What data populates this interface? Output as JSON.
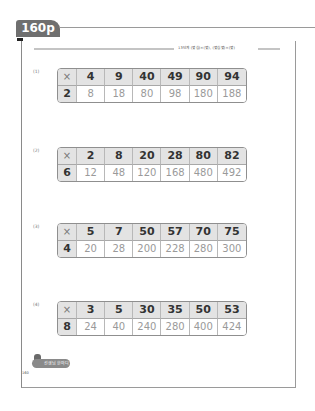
{
  "page_tab": {
    "label": "160p"
  },
  "header": {
    "text": "13단계 (몇십)×(몇), (몇십몇)×(몇)"
  },
  "problems": [
    {
      "number": "(1)",
      "top": 68,
      "operator": "×",
      "multiplier": "2",
      "values": [
        "4",
        "9",
        "40",
        "49",
        "90",
        "94"
      ],
      "products": [
        "8",
        "18",
        "80",
        "98",
        "180",
        "188"
      ]
    },
    {
      "number": "(2)",
      "top": 147,
      "operator": "×",
      "multiplier": "6",
      "values": [
        "2",
        "8",
        "20",
        "28",
        "80",
        "82"
      ],
      "products": [
        "12",
        "48",
        "120",
        "168",
        "480",
        "492"
      ]
    },
    {
      "number": "(3)",
      "top": 223,
      "operator": "×",
      "multiplier": "4",
      "values": [
        "5",
        "7",
        "50",
        "57",
        "70",
        "75"
      ],
      "products": [
        "20",
        "28",
        "200",
        "228",
        "280",
        "300"
      ]
    },
    {
      "number": "(4)",
      "top": 301,
      "operator": "×",
      "multiplier": "8",
      "values": [
        "3",
        "5",
        "30",
        "35",
        "50",
        "53"
      ],
      "products": [
        "24",
        "40",
        "240",
        "280",
        "400",
        "424"
      ]
    }
  ],
  "footer": {
    "badge": "선생님 한마디",
    "note": "",
    "page_number": "160"
  },
  "colors": {
    "tab": "#6f6f6f",
    "header_cell": "#e3e3e3",
    "border": "#8f8f8f",
    "answer_text": "#9a9a9a"
  }
}
